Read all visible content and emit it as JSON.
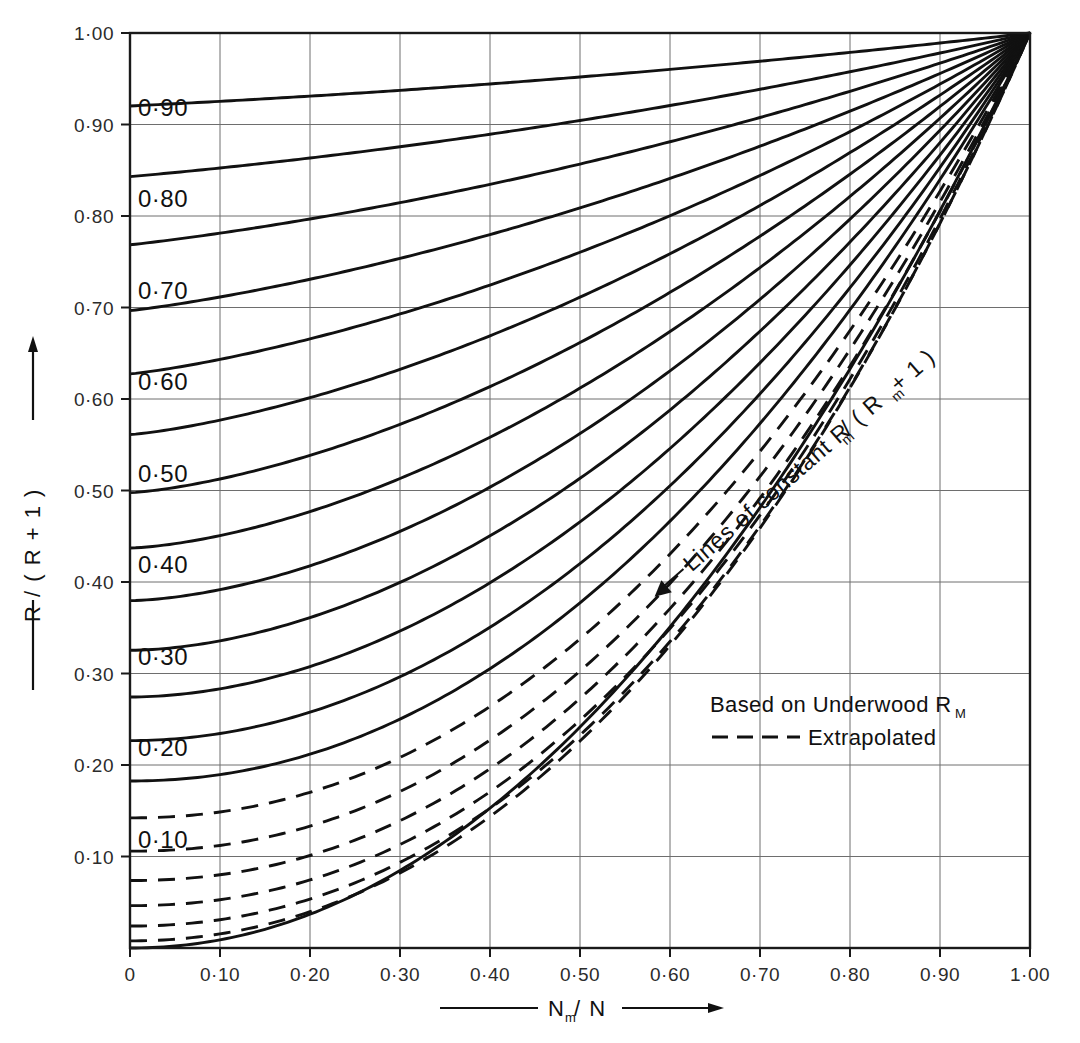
{
  "chart_data": {
    "type": "line",
    "title": "",
    "xlabel": "N_m / N",
    "ylabel": "R / ( R + 1 )",
    "xlim": [
      0,
      1.0
    ],
    "ylim": [
      0,
      1.0
    ],
    "grid": true,
    "x_ticks": [
      0,
      0.1,
      0.2,
      0.3,
      0.4,
      0.5,
      0.6,
      0.7,
      0.8,
      0.9,
      1.0
    ],
    "x_tick_labels": [
      "0",
      "0·10",
      "0·20",
      "0·30",
      "0·40",
      "0·50",
      "0·60",
      "0·70",
      "0·80",
      "0·90",
      "1·00"
    ],
    "y_ticks": [
      0.1,
      0.2,
      0.3,
      0.4,
      0.5,
      0.6,
      0.7,
      0.8,
      0.9,
      1.0
    ],
    "y_tick_labels": [
      "0·10",
      "0·20",
      "0·30",
      "0·40",
      "0·50",
      "0·60",
      "0·70",
      "0·80",
      "0·90",
      "1·00"
    ],
    "legend_position": "inside-lower-right",
    "annotation": "Lines of constant R_m / (R_m + 1)",
    "series": [
      {
        "name": "0.00",
        "intercept": 0.0,
        "label": "",
        "style": "solid",
        "labeled": false
      },
      {
        "name": "0.05",
        "intercept": 0.05,
        "label": "",
        "style": "dashed",
        "labeled": false
      },
      {
        "name": "0.10",
        "intercept": 0.1,
        "label": "0·10",
        "style": "dashed",
        "labeled": true
      },
      {
        "name": "0.15",
        "intercept": 0.15,
        "label": "",
        "style": "dashed",
        "labeled": false
      },
      {
        "name": "0.20",
        "intercept": 0.2,
        "label": "0·20",
        "style": "dashed",
        "labeled": true
      },
      {
        "name": "0.25",
        "intercept": 0.25,
        "label": "",
        "style": "dashed",
        "labeled": false
      },
      {
        "name": "0.30",
        "intercept": 0.3,
        "label": "0·30",
        "style": "dashed",
        "labeled": true
      },
      {
        "name": "0.35",
        "intercept": 0.35,
        "label": "",
        "style": "solid",
        "labeled": false
      },
      {
        "name": "0.40",
        "intercept": 0.4,
        "label": "0·40",
        "style": "solid",
        "labeled": true
      },
      {
        "name": "0.45",
        "intercept": 0.45,
        "label": "",
        "style": "solid",
        "labeled": false
      },
      {
        "name": "0.50",
        "intercept": 0.5,
        "label": "0·50",
        "style": "solid",
        "labeled": true
      },
      {
        "name": "0.55",
        "intercept": 0.55,
        "label": "",
        "style": "solid",
        "labeled": false
      },
      {
        "name": "0.60",
        "intercept": 0.6,
        "label": "0·60",
        "style": "solid",
        "labeled": true
      },
      {
        "name": "0.65",
        "intercept": 0.65,
        "label": "",
        "style": "solid",
        "labeled": false
      },
      {
        "name": "0.70",
        "intercept": 0.7,
        "label": "0·70",
        "style": "solid",
        "labeled": true
      },
      {
        "name": "0.75",
        "intercept": 0.75,
        "label": "",
        "style": "solid",
        "labeled": false
      },
      {
        "name": "0.80",
        "intercept": 0.8,
        "label": "0·80",
        "style": "solid",
        "labeled": true
      },
      {
        "name": "0.85",
        "intercept": 0.85,
        "label": "",
        "style": "solid",
        "labeled": false
      },
      {
        "name": "0.90",
        "intercept": 0.9,
        "label": "0·90",
        "style": "solid",
        "labeled": true
      },
      {
        "name": "0.95",
        "intercept": 0.95,
        "label": "",
        "style": "solid",
        "labeled": false
      }
    ]
  },
  "axes": {
    "y_axis_title": "R / ( R + 1 )",
    "x_axis_title_main": "N",
    "x_axis_title_sub": "m",
    "x_axis_title_rest": "/ N"
  },
  "legend": {
    "line1_main": "Based on Underwood  R",
    "line1_sub": "M",
    "line2": "Extrapolated"
  },
  "annotation": {
    "main_a": "Lines of constant  R",
    "sub_a": "m",
    "main_b": " / ( R",
    "sub_b": "m",
    "main_c": " + 1 )"
  },
  "colors": {
    "axis": "#1a1a1a",
    "grid": "#6e6e6e",
    "curve": "#111111",
    "text": "#111111",
    "background": "#ffffff"
  }
}
